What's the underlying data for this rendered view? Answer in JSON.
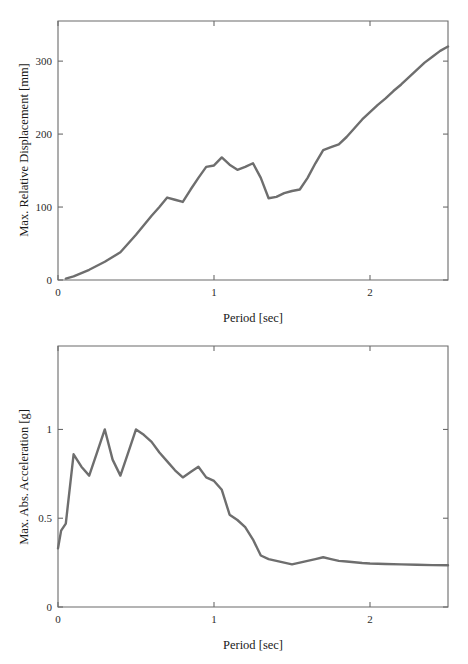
{
  "figure": {
    "title": "",
    "line_color": "#6e6e6e",
    "axis_color": "#6b6b6b",
    "background": "#ffffff"
  },
  "chart_data": [
    {
      "id": "displacement",
      "type": "line",
      "title": "",
      "xlabel": "Period [sec]",
      "ylabel": "Max. Relative Displacement [mm]",
      "xlim": [
        0,
        2.5
      ],
      "ylim": [
        0,
        355
      ],
      "xticks": [
        0,
        1,
        2
      ],
      "xticklabels": [
        "0",
        "1",
        "2"
      ],
      "yticks": [
        0,
        100,
        200,
        300
      ],
      "yticklabels": [
        "0",
        "100",
        "200",
        "300"
      ],
      "grid": false,
      "legend": null,
      "box": true,
      "series": [
        {
          "name": "Max. Relative Displacement",
          "color": "#6e6e6e",
          "x": [
            0.05,
            0.1,
            0.2,
            0.3,
            0.4,
            0.5,
            0.6,
            0.65,
            0.7,
            0.75,
            0.8,
            0.85,
            0.9,
            0.95,
            1.0,
            1.05,
            1.1,
            1.15,
            1.2,
            1.25,
            1.3,
            1.35,
            1.4,
            1.45,
            1.5,
            1.55,
            1.6,
            1.65,
            1.7,
            1.75,
            1.8,
            1.85,
            1.9,
            1.95,
            2.0,
            2.05,
            2.1,
            2.15,
            2.2,
            2.25,
            2.3,
            2.35,
            2.4,
            2.45,
            2.5
          ],
          "y": [
            2,
            5,
            14,
            25,
            38,
            62,
            88,
            100,
            113,
            110,
            107,
            124,
            140,
            155,
            157,
            168,
            158,
            151,
            155,
            160,
            140,
            112,
            114,
            119,
            122,
            124,
            140,
            160,
            178,
            182,
            186,
            196,
            208,
            220,
            230,
            240,
            249,
            259,
            268,
            278,
            288,
            298,
            306,
            314,
            320
          ]
        }
      ]
    },
    {
      "id": "acceleration",
      "type": "line",
      "title": "",
      "xlabel": "Period [sec]",
      "ylabel": "Max. Abs. Acceleration [g]",
      "xlim": [
        0,
        2.5
      ],
      "ylim": [
        0,
        1.47
      ],
      "xticks": [
        0,
        1,
        2
      ],
      "xticklabels": [
        "0",
        "1",
        "2"
      ],
      "yticks": [
        0,
        0.5,
        1
      ],
      "yticklabels": [
        "0",
        "0.5",
        "1"
      ],
      "grid": false,
      "legend": null,
      "box": true,
      "series": [
        {
          "name": "Max. Abs. Acceleration",
          "color": "#6e6e6e",
          "x": [
            0.0,
            0.02,
            0.05,
            0.1,
            0.15,
            0.2,
            0.25,
            0.3,
            0.35,
            0.4,
            0.45,
            0.5,
            0.55,
            0.6,
            0.65,
            0.7,
            0.75,
            0.8,
            0.85,
            0.9,
            0.95,
            1.0,
            1.05,
            1.1,
            1.15,
            1.2,
            1.25,
            1.3,
            1.35,
            1.4,
            1.45,
            1.5,
            1.55,
            1.6,
            1.65,
            1.7,
            1.75,
            1.8,
            1.85,
            1.9,
            1.95,
            2.0,
            2.1,
            2.2,
            2.3,
            2.4,
            2.5
          ],
          "y": [
            0.33,
            0.43,
            0.47,
            0.86,
            0.79,
            0.74,
            0.87,
            1.0,
            0.83,
            0.74,
            0.87,
            1.0,
            0.97,
            0.93,
            0.87,
            0.82,
            0.77,
            0.73,
            0.76,
            0.79,
            0.73,
            0.71,
            0.66,
            0.52,
            0.49,
            0.45,
            0.38,
            0.29,
            0.27,
            0.26,
            0.25,
            0.24,
            0.25,
            0.26,
            0.27,
            0.28,
            0.27,
            0.26,
            0.256,
            0.252,
            0.248,
            0.245,
            0.242,
            0.24,
            0.238,
            0.236,
            0.235
          ]
        }
      ]
    }
  ]
}
